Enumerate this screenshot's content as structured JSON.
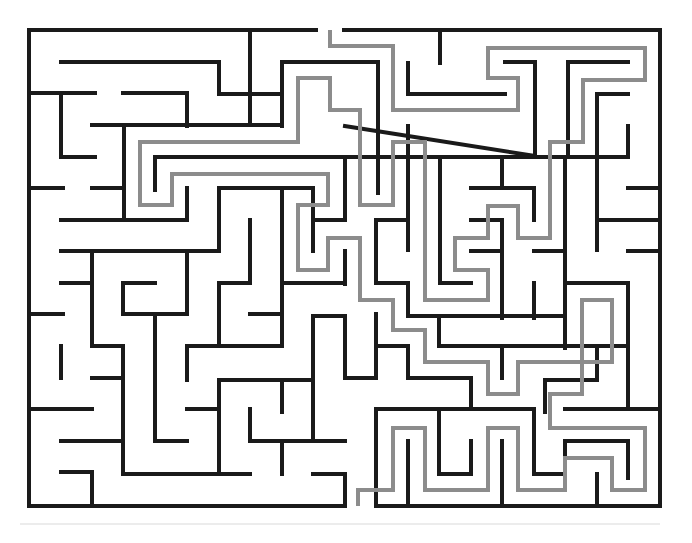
{
  "puzzle": {
    "type": "maze",
    "grid": {
      "cols": 20,
      "rows": 15,
      "left": 29,
      "top": 30,
      "right": 660,
      "bottom": 506
    },
    "colors": {
      "wall": "#1a1a1a",
      "solution": "#8c8c8c",
      "background": "#ffffff"
    },
    "entrance": {
      "x": 330,
      "y": 30,
      "side": "top"
    },
    "exit": {
      "x": 358,
      "y": 506,
      "side": "bottom"
    },
    "walls": [
      [
        [
          29,
          30
        ],
        [
          316,
          30
        ]
      ],
      [
        [
          344,
          30
        ],
        [
          660,
          30
        ],
        [
          660,
          506
        ],
        [
          376,
          506
        ]
      ],
      [
        [
          344,
          506
        ],
        [
          29,
          506
        ],
        [
          29,
          30
        ]
      ],
      [
        [
          250,
          30
        ],
        [
          250,
          63
        ]
      ],
      [
        [
          61,
          62
        ],
        [
          219,
          62
        ],
        [
          219,
          94
        ],
        [
          282,
          94
        ]
      ],
      [
        [
          282,
          126
        ],
        [
          282,
          62
        ],
        [
          378,
          62
        ],
        [
          378,
          193
        ]
      ],
      [
        [
          29,
          93
        ],
        [
          95,
          93
        ]
      ],
      [
        [
          61,
          93
        ],
        [
          61,
          157
        ],
        [
          95,
          157
        ]
      ],
      [
        [
          123,
          93
        ],
        [
          187,
          93
        ],
        [
          187,
          126
        ]
      ],
      [
        [
          92,
          125
        ],
        [
          282,
          125
        ]
      ],
      [
        [
          124,
          125
        ],
        [
          124,
          220
        ]
      ],
      [
        [
          29,
          188
        ],
        [
          63,
          188
        ]
      ],
      [
        [
          92,
          188
        ],
        [
          124,
          188
        ]
      ],
      [
        [
          155,
          157
        ],
        [
          345,
          157
        ]
      ],
      [
        [
          155,
          157
        ],
        [
          155,
          190
        ]
      ],
      [
        [
          187,
          188
        ],
        [
          187,
          220
        ],
        [
          61,
          220
        ]
      ],
      [
        [
          219,
          188
        ],
        [
          313,
          188
        ]
      ],
      [
        [
          313,
          188
        ],
        [
          313,
          251
        ]
      ],
      [
        [
          250,
          62
        ],
        [
          250,
          125
        ]
      ],
      [
        [
          345,
          157
        ],
        [
          345,
          220
        ]
      ],
      [
        [
          408,
          94
        ],
        [
          408,
          63
        ]
      ],
      [
        [
          440,
          30
        ],
        [
          440,
          63
        ]
      ],
      [
        [
          408,
          94
        ],
        [
          505,
          94
        ]
      ],
      [
        [
          505,
          62
        ],
        [
          535,
          62
        ],
        [
          535,
          156
        ],
        [
          345,
          126
        ]
      ],
      [
        [
          568,
          62
        ],
        [
          628,
          62
        ]
      ],
      [
        [
          568,
          62
        ],
        [
          568,
          157
        ],
        [
          345,
          157
        ]
      ],
      [
        [
          597,
          94
        ],
        [
          628,
          94
        ]
      ],
      [
        [
          597,
          94
        ],
        [
          597,
          250
        ]
      ],
      [
        [
          628,
          126
        ],
        [
          628,
          157
        ],
        [
          565,
          157
        ],
        [
          565,
          348
        ]
      ],
      [
        [
          628,
          188
        ],
        [
          660,
          188
        ]
      ],
      [
        [
          628,
          220
        ],
        [
          660,
          220
        ]
      ],
      [
        [
          628,
          251
        ],
        [
          660,
          251
        ]
      ],
      [
        [
          597,
          220
        ],
        [
          628,
          220
        ]
      ],
      [
        [
          502,
          157
        ],
        [
          502,
          188
        ]
      ],
      [
        [
          471,
          188
        ],
        [
          534,
          188
        ],
        [
          534,
          220
        ]
      ],
      [
        [
          440,
          157
        ],
        [
          471,
          157
        ]
      ],
      [
        [
          440,
          157
        ],
        [
          440,
          283
        ],
        [
          471,
          283
        ]
      ],
      [
        [
          471,
          220
        ],
        [
          502,
          220
        ]
      ],
      [
        [
          471,
          251
        ],
        [
          502,
          251
        ]
      ],
      [
        [
          502,
          220
        ],
        [
          502,
          318
        ]
      ],
      [
        [
          534,
          251
        ],
        [
          565,
          251
        ]
      ],
      [
        [
          534,
          283
        ],
        [
          534,
          318
        ]
      ],
      [
        [
          408,
          126
        ],
        [
          408,
          250
        ]
      ],
      [
        [
          376,
          220
        ],
        [
          408,
          220
        ]
      ],
      [
        [
          376,
          220
        ],
        [
          376,
          283
        ],
        [
          408,
          283
        ],
        [
          408,
          316
        ],
        [
          565,
          316
        ]
      ],
      [
        [
          345,
          251
        ],
        [
          345,
          284
        ]
      ],
      [
        [
          313,
          220
        ],
        [
          345,
          220
        ]
      ],
      [
        [
          282,
          188
        ],
        [
          282,
          283
        ],
        [
          345,
          283
        ]
      ],
      [
        [
          219,
          188
        ],
        [
          219,
          251
        ],
        [
          187,
          251
        ]
      ],
      [
        [
          61,
          251
        ],
        [
          219,
          251
        ]
      ],
      [
        [
          92,
          251
        ],
        [
          92,
          346
        ],
        [
          123,
          346
        ]
      ],
      [
        [
          61,
          283
        ],
        [
          92,
          283
        ]
      ],
      [
        [
          29,
          314
        ],
        [
          63,
          314
        ]
      ],
      [
        [
          123,
          283
        ],
        [
          155,
          283
        ]
      ],
      [
        [
          123,
          283
        ],
        [
          123,
          314
        ],
        [
          187,
          314
        ],
        [
          187,
          251
        ]
      ],
      [
        [
          155,
          314
        ],
        [
          155,
          441
        ],
        [
          187,
          441
        ]
      ],
      [
        [
          250,
          220
        ],
        [
          250,
          283
        ]
      ],
      [
        [
          219,
          283
        ],
        [
          250,
          283
        ]
      ],
      [
        [
          219,
          283
        ],
        [
          219,
          346
        ]
      ],
      [
        [
          250,
          314
        ],
        [
          282,
          314
        ]
      ],
      [
        [
          282,
          283
        ],
        [
          282,
          346
        ],
        [
          187,
          346
        ],
        [
          187,
          380
        ]
      ],
      [
        [
          313,
          316
        ],
        [
          345,
          316
        ],
        [
          345,
          378
        ]
      ],
      [
        [
          313,
          316
        ],
        [
          313,
          441
        ]
      ],
      [
        [
          61,
          346
        ],
        [
          61,
          378
        ]
      ],
      [
        [
          92,
          378
        ],
        [
          123,
          378
        ]
      ],
      [
        [
          123,
          346
        ],
        [
          123,
          474
        ],
        [
          250,
          474
        ]
      ],
      [
        [
          29,
          409
        ],
        [
          92,
          409
        ]
      ],
      [
        [
          61,
          441
        ],
        [
          123,
          441
        ]
      ],
      [
        [
          61,
          472
        ],
        [
          92,
          472
        ],
        [
          92,
          506
        ]
      ],
      [
        [
          187,
          409
        ],
        [
          219,
          409
        ]
      ],
      [
        [
          219,
          380
        ],
        [
          313,
          380
        ]
      ],
      [
        [
          219,
          380
        ],
        [
          219,
          474
        ]
      ],
      [
        [
          282,
          380
        ],
        [
          282,
          412
        ]
      ],
      [
        [
          250,
          409
        ],
        [
          250,
          441
        ],
        [
          345,
          441
        ]
      ],
      [
        [
          282,
          441
        ],
        [
          282,
          474
        ]
      ],
      [
        [
          313,
          474
        ],
        [
          345,
          474
        ],
        [
          345,
          506
        ]
      ],
      [
        [
          345,
          378
        ],
        [
          376,
          378
        ]
      ],
      [
        [
          376,
          314
        ],
        [
          376,
          378
        ]
      ],
      [
        [
          376,
          346
        ],
        [
          408,
          346
        ],
        [
          408,
          378
        ],
        [
          471,
          378
        ],
        [
          471,
          409
        ],
        [
          534,
          409
        ]
      ],
      [
        [
          376,
          409
        ],
        [
          376,
          506
        ]
      ],
      [
        [
          376,
          409
        ],
        [
          471,
          409
        ]
      ],
      [
        [
          408,
          441
        ],
        [
          408,
          506
        ]
      ],
      [
        [
          439,
          409
        ],
        [
          439,
          474
        ],
        [
          471,
          474
        ]
      ],
      [
        [
          502,
          346
        ],
        [
          502,
          378
        ]
      ],
      [
        [
          439,
          316
        ],
        [
          439,
          346
        ],
        [
          628,
          346
        ]
      ],
      [
        [
          534,
          409
        ],
        [
          534,
          474
        ],
        [
          565,
          474
        ]
      ],
      [
        [
          565,
          441
        ],
        [
          565,
          474
        ]
      ],
      [
        [
          597,
          346
        ],
        [
          597,
          380
        ],
        [
          545,
          380
        ],
        [
          545,
          412
        ]
      ],
      [
        [
          565,
          409
        ],
        [
          660,
          409
        ]
      ],
      [
        [
          628,
          283
        ],
        [
          628,
          409
        ]
      ],
      [
        [
          565,
          283
        ],
        [
          628,
          283
        ]
      ],
      [
        [
          502,
          441
        ],
        [
          502,
          506
        ]
      ],
      [
        [
          565,
          441
        ],
        [
          628,
          441
        ],
        [
          628,
          478
        ]
      ],
      [
        [
          597,
          474
        ],
        [
          597,
          506
        ]
      ],
      [
        [
          471,
          441
        ],
        [
          471,
          474
        ]
      ]
    ],
    "solution_path": [
      [
        330,
        30
      ],
      [
        330,
        46
      ],
      [
        393,
        46
      ],
      [
        393,
        110
      ],
      [
        518,
        110
      ],
      [
        518,
        78
      ],
      [
        488,
        78
      ],
      [
        488,
        48
      ],
      [
        645,
        48
      ],
      [
        645,
        80
      ],
      [
        583,
        80
      ],
      [
        583,
        142
      ],
      [
        550,
        142
      ],
      [
        550,
        238
      ],
      [
        518,
        238
      ],
      [
        518,
        206
      ],
      [
        488,
        206
      ],
      [
        488,
        238
      ],
      [
        455,
        238
      ],
      [
        455,
        270
      ],
      [
        488,
        270
      ],
      [
        488,
        300
      ],
      [
        425,
        300
      ],
      [
        425,
        142
      ],
      [
        393,
        142
      ],
      [
        393,
        205
      ],
      [
        360,
        205
      ],
      [
        360,
        110
      ],
      [
        330,
        110
      ],
      [
        330,
        78
      ],
      [
        298,
        78
      ],
      [
        298,
        142
      ],
      [
        140,
        142
      ],
      [
        140,
        205
      ],
      [
        172,
        205
      ],
      [
        172,
        174
      ],
      [
        328,
        174
      ],
      [
        328,
        205
      ],
      [
        298,
        205
      ],
      [
        298,
        270
      ],
      [
        328,
        270
      ],
      [
        328,
        238
      ],
      [
        360,
        238
      ],
      [
        360,
        300
      ],
      [
        393,
        300
      ],
      [
        393,
        330
      ],
      [
        425,
        330
      ],
      [
        425,
        362
      ],
      [
        488,
        362
      ],
      [
        488,
        394
      ],
      [
        518,
        394
      ],
      [
        518,
        362
      ],
      [
        612,
        362
      ],
      [
        612,
        300
      ],
      [
        582,
        300
      ],
      [
        582,
        394
      ],
      [
        550,
        394
      ],
      [
        550,
        428
      ],
      [
        645,
        428
      ],
      [
        645,
        490
      ],
      [
        612,
        490
      ],
      [
        612,
        458
      ],
      [
        565,
        458
      ],
      [
        565,
        490
      ],
      [
        518,
        490
      ],
      [
        518,
        428
      ],
      [
        488,
        428
      ],
      [
        488,
        490
      ],
      [
        425,
        490
      ],
      [
        425,
        428
      ],
      [
        393,
        428
      ],
      [
        393,
        490
      ],
      [
        358,
        490
      ],
      [
        358,
        506
      ]
    ]
  }
}
